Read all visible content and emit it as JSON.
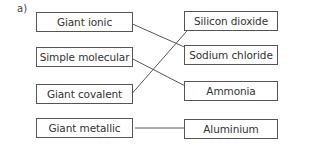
{
  "question": {
    "part_label": "a)"
  },
  "left_column": [
    {
      "label": "Giant ionic",
      "top": 12
    },
    {
      "label": "Simple molecular",
      "top": 47
    },
    {
      "label": "Giant covalent",
      "top": 84
    },
    {
      "label": "Giant metallic",
      "top": 118
    }
  ],
  "right_column": [
    {
      "label": "Silicon dioxide",
      "top": 11
    },
    {
      "label": "Sodium chloride",
      "top": 45
    },
    {
      "label": "Ammonia",
      "top": 81
    },
    {
      "label": "Aluminium",
      "top": 119
    }
  ],
  "connections": [
    {
      "from": "Giant ionic",
      "to": "Sodium chloride"
    },
    {
      "from": "Simple molecular",
      "to": "Ammonia"
    },
    {
      "from": "Giant covalent",
      "to": "Silicon dioxide"
    },
    {
      "from": "Giant metallic",
      "to": "Aluminium"
    }
  ]
}
